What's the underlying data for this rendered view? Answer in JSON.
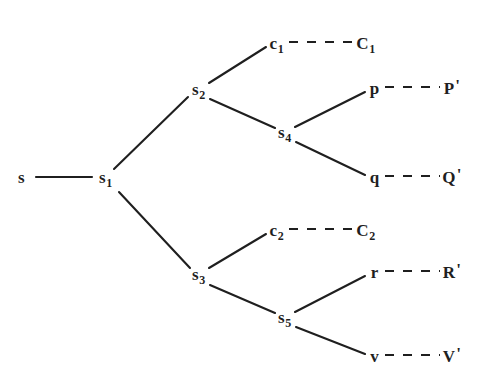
{
  "figure": {
    "width": 490,
    "height": 388,
    "background": "#ffffff",
    "ink_color": "#1f1f1f"
  },
  "nodes": {
    "root": {
      "base": "s",
      "sub": "",
      "prime": "",
      "x": 22,
      "y": 178
    },
    "s1": {
      "base": "s",
      "sub": "1",
      "prime": "",
      "x": 106,
      "y": 178
    },
    "s2": {
      "base": "s",
      "sub": "2",
      "prime": "",
      "x": 199,
      "y": 90
    },
    "s3": {
      "base": "s",
      "sub": "3",
      "prime": "",
      "x": 199,
      "y": 275
    },
    "s4": {
      "base": "s",
      "sub": "4",
      "prime": "",
      "x": 285,
      "y": 133
    },
    "s5": {
      "base": "s",
      "sub": "5",
      "prime": "",
      "x": 285,
      "y": 318
    },
    "c1": {
      "base": "c",
      "sub": "1",
      "prime": "",
      "x": 277,
      "y": 44
    },
    "C1": {
      "base": "C",
      "sub": "1",
      "prime": "",
      "x": 366,
      "y": 44
    },
    "c2": {
      "base": "c",
      "sub": "2",
      "prime": "",
      "x": 277,
      "y": 231
    },
    "C2": {
      "base": "C",
      "sub": "2",
      "prime": "",
      "x": 366,
      "y": 231
    },
    "p": {
      "base": "p",
      "sub": "",
      "prime": "",
      "x": 375,
      "y": 89
    },
    "Pprime": {
      "base": "P",
      "sub": "",
      "prime": "'",
      "x": 452,
      "y": 89
    },
    "q": {
      "base": "q",
      "sub": "",
      "prime": "",
      "x": 375,
      "y": 178
    },
    "Qprime": {
      "base": "Q",
      "sub": "",
      "prime": "'",
      "x": 452,
      "y": 178
    },
    "r": {
      "base": "r",
      "sub": "",
      "prime": "",
      "x": 375,
      "y": 273
    },
    "Rprime": {
      "base": "R",
      "sub": "",
      "prime": "'",
      "x": 452,
      "y": 273
    },
    "v": {
      "base": "v",
      "sub": "",
      "prime": "",
      "x": 375,
      "y": 357
    },
    "Vprime": {
      "base": "V",
      "sub": "",
      "prime": "'",
      "x": 452,
      "y": 357
    }
  },
  "solid_edges": [
    {
      "name": "root-to-s1",
      "from": "root",
      "to": "s1",
      "x1": 36,
      "y1": 177,
      "x2": 92,
      "y2": 177
    },
    {
      "name": "s1-to-s2",
      "from": "s1",
      "to": "s2",
      "x1": 114,
      "y1": 169,
      "x2": 188,
      "y2": 97
    },
    {
      "name": "s1-to-s3",
      "from": "s1",
      "to": "s3",
      "x1": 119,
      "y1": 192,
      "x2": 190,
      "y2": 268
    },
    {
      "name": "s2-to-c1",
      "from": "s2",
      "to": "c1",
      "x1": 209,
      "y1": 83,
      "x2": 266,
      "y2": 47
    },
    {
      "name": "s2-to-s4",
      "from": "s2",
      "to": "s4",
      "x1": 210,
      "y1": 99,
      "x2": 275,
      "y2": 128
    },
    {
      "name": "s4-to-p",
      "from": "s4",
      "to": "p",
      "x1": 295,
      "y1": 127,
      "x2": 365,
      "y2": 92
    },
    {
      "name": "s4-to-q",
      "from": "s4",
      "to": "q",
      "x1": 296,
      "y1": 142,
      "x2": 365,
      "y2": 175
    },
    {
      "name": "s3-to-c2",
      "from": "s3",
      "to": "c2",
      "x1": 209,
      "y1": 268,
      "x2": 266,
      "y2": 234
    },
    {
      "name": "s3-to-s5",
      "from": "s3",
      "to": "s5",
      "x1": 210,
      "y1": 285,
      "x2": 275,
      "y2": 313
    },
    {
      "name": "s5-to-r",
      "from": "s5",
      "to": "r",
      "x1": 295,
      "y1": 312,
      "x2": 365,
      "y2": 276
    },
    {
      "name": "s5-to-v",
      "from": "s5",
      "to": "v",
      "x1": 296,
      "y1": 327,
      "x2": 365,
      "y2": 354
    }
  ],
  "dashed_edges": [
    {
      "name": "c1-to-C1",
      "from": "c1",
      "to": "C1",
      "x1": 289,
      "y1": 42,
      "x2": 354,
      "y2": 42
    },
    {
      "name": "p-to-P",
      "from": "p",
      "to": "Pprime",
      "x1": 385,
      "y1": 87,
      "x2": 440,
      "y2": 87
    },
    {
      "name": "q-to-Q",
      "from": "q",
      "to": "Qprime",
      "x1": 385,
      "y1": 176,
      "x2": 440,
      "y2": 176
    },
    {
      "name": "c2-to-C2",
      "from": "c2",
      "to": "C2",
      "x1": 289,
      "y1": 229,
      "x2": 354,
      "y2": 229
    },
    {
      "name": "r-to-R",
      "from": "r",
      "to": "Rprime",
      "x1": 385,
      "y1": 271,
      "x2": 440,
      "y2": 271
    },
    {
      "name": "v-to-V",
      "from": "v",
      "to": "Vprime",
      "x1": 385,
      "y1": 355,
      "x2": 440,
      "y2": 355
    }
  ]
}
